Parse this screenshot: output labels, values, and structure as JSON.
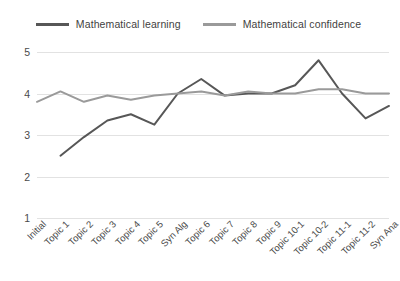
{
  "chart_data": {
    "type": "line",
    "title": "",
    "xlabel": "",
    "ylabel": "",
    "ylim": [
      1,
      5
    ],
    "yticks": [
      1,
      2,
      3,
      4,
      5
    ],
    "grid": true,
    "legend_position": "top-center",
    "categories": [
      "Initial",
      "Topic 1",
      "Topic 2",
      "Topic 3",
      "Topic 4",
      "Topic 5",
      "Syn Alg",
      "Topic 6",
      "Topic 7",
      "Topic 8",
      "Topic 9",
      "Topic 10-1",
      "Topic 10-2",
      "Topic 11-1",
      "Topic 11-2",
      "Syn Ana"
    ],
    "series": [
      {
        "name": "Mathematical learning",
        "color": "#575757",
        "values": [
          null,
          2.5,
          2.95,
          3.35,
          3.5,
          3.25,
          4.0,
          4.35,
          3.95,
          4.0,
          4.0,
          4.2,
          4.8,
          4.0,
          3.4,
          3.7
        ]
      },
      {
        "name": "Mathematical confidence",
        "color": "#9a9a9a",
        "values": [
          3.8,
          4.05,
          3.8,
          3.95,
          3.85,
          3.95,
          4.0,
          4.05,
          3.95,
          4.05,
          4.0,
          4.0,
          4.1,
          4.1,
          4.0,
          4.0
        ]
      }
    ]
  },
  "legend": {
    "items": [
      {
        "label": "Mathematical learning",
        "color": "#575757"
      },
      {
        "label": "Mathematical confidence",
        "color": "#9a9a9a"
      }
    ]
  }
}
